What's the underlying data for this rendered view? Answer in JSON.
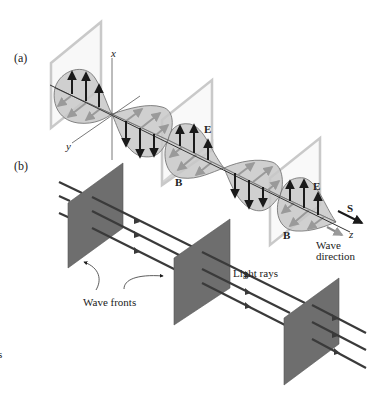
{
  "figure": {
    "panel_a": {
      "label": "(a)",
      "axes": {
        "x": "x",
        "y": "y",
        "z": "z"
      },
      "field_labels": [
        {
          "id": "E1",
          "text": "E"
        },
        {
          "id": "B1",
          "text": "B"
        },
        {
          "id": "E2",
          "text": "E"
        },
        {
          "id": "B2",
          "text": "B"
        }
      ],
      "poynting_label": "S",
      "wave_direction_line1": "Wave",
      "wave_direction_line2": "direction"
    },
    "panel_b": {
      "label": "(b)",
      "light_rays_label": "Light rays",
      "wave_fronts_label": "Wave fronts",
      "wave_front_count": 3,
      "ray_count": 3
    },
    "stray_margin_text": "s"
  },
  "colors": {
    "background": "#ffffff",
    "lobe_fill": "#c8c8c8",
    "lobe_stroke": "#6a6a6a",
    "plane_light": "#d6d6d6",
    "plane_edge": "#bdbdbd",
    "wave_front_fill": "#6e6e6e",
    "ray": "#3a3a3a",
    "arrow_dark": "#1a1a1a",
    "b_arrow": "#9a9a9a"
  }
}
